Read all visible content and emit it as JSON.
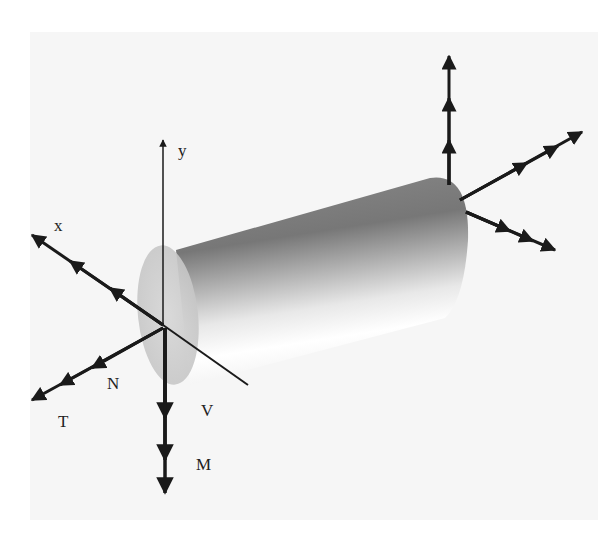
{
  "figure": {
    "labels": {
      "y_axis": "y",
      "x_axis": "x",
      "normal_force": "N",
      "torque": "T",
      "shear_force": "V",
      "moment": "M"
    },
    "colors": {
      "background": "#f6f6f6",
      "ink": "#1a1a1a",
      "cylinder_dark": "#6e6e6e",
      "cylinder_light": "#ffffff",
      "end_cap": "#cfcfcf"
    }
  }
}
